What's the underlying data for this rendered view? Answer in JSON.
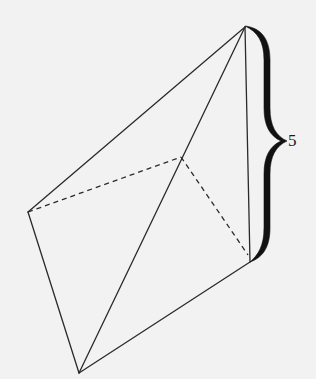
{
  "diagram": {
    "type": "3d-solid-pyramid",
    "vertices": {
      "apex": [
        245,
        27
      ],
      "left": [
        28,
        212
      ],
      "bottom": [
        79,
        373
      ],
      "right": [
        250,
        262
      ],
      "back": [
        181,
        157
      ]
    },
    "visible_edges": [
      [
        "apex",
        "left"
      ],
      [
        "apex",
        "bottom"
      ],
      [
        "apex",
        "right"
      ],
      [
        "left",
        "bottom"
      ],
      [
        "bottom",
        "right"
      ]
    ],
    "hidden_edges": [
      [
        "left",
        "back"
      ],
      [
        "back",
        "right"
      ]
    ],
    "dimension": {
      "edge": [
        "apex",
        "right"
      ],
      "label": "5"
    },
    "colors": {
      "background": "#f2f2f2",
      "stroke": "#2a2a2a"
    }
  }
}
